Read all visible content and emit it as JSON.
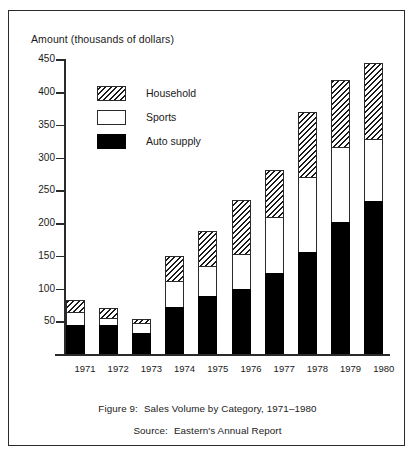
{
  "figure": {
    "axis_title": "Amount (thousands of dollars)",
    "caption_figure_label": "Figure 9:",
    "caption_figure_text": "Sales Volume by Category, 1971–1980",
    "caption_source_label": "Source:",
    "caption_source_text": "Eastern's Annual Report"
  },
  "legend": {
    "position": "inside-top-left",
    "items": [
      {
        "label": "Household",
        "swatch": "diagonal-hatch",
        "color": "#ffffff"
      },
      {
        "label": "Sports",
        "swatch": "open-white",
        "color": "#ffffff"
      },
      {
        "label": "Auto supply",
        "swatch": "solid-black",
        "color": "#000000"
      }
    ]
  },
  "chart_data": {
    "type": "bar",
    "stacked": true,
    "title": "Sales Volume by Category, 1971–1980",
    "xlabel": "",
    "ylabel": "Amount (thousands of dollars)",
    "ylim": [
      0,
      470
    ],
    "yticks": [
      50,
      100,
      150,
      200,
      250,
      300,
      350,
      400,
      450
    ],
    "ytick_labels": [
      "50",
      "100",
      "150",
      "200",
      "250",
      "300",
      "350",
      "400",
      "450"
    ],
    "grid": false,
    "categories": [
      "1971",
      "1972",
      "1973",
      "1974",
      "1975",
      "1976",
      "1977",
      "1978",
      "1979",
      "1980"
    ],
    "series": [
      {
        "name": "Auto supply",
        "values": [
          44,
          44,
          32,
          72,
          88,
          100,
          124,
          156,
          202,
          234
        ]
      },
      {
        "name": "Sports",
        "values": [
          20,
          11,
          16,
          39,
          46,
          53,
          85,
          114,
          114,
          94
        ]
      },
      {
        "name": "Household",
        "values": [
          18,
          15,
          5,
          39,
          54,
          82,
          72,
          100,
          102,
          117
        ]
      }
    ],
    "totals": [
      82,
      70,
      53,
      150,
      188,
      235,
      281,
      370,
      418,
      445
    ]
  }
}
